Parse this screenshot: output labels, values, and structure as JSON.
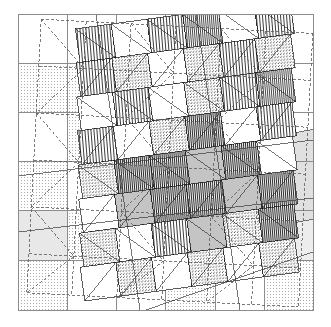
{
  "figure": {
    "name": "overlaid-triangulated-meshes",
    "caption_residue": "· · · · ·",
    "background_color": "#ffffff",
    "frame": {
      "x": 18,
      "y": 14,
      "width": 295,
      "height": 296,
      "stroke": "#8c8c8c",
      "stroke_width": 1
    },
    "layers": [
      {
        "id": "base-grid",
        "label": "axis-aligned background grid",
        "style": "solid",
        "stroke": "#8c8c8c",
        "stroke_width": 1,
        "rotation_deg": 0,
        "cols": 6,
        "rows": 6
      },
      {
        "id": "dashed-grid",
        "label": "dashed intermediate mesh",
        "style": "dashed",
        "stroke": "#6e6e6e",
        "stroke_width": 0.8,
        "dash": "3 2",
        "rotation_deg": 3,
        "cols": 6,
        "rows": 6
      },
      {
        "id": "rotated-mesh",
        "label": "rotated triangulated mesh",
        "style": "solid",
        "stroke": "#1a1a1a",
        "stroke_width": 0.7,
        "rotation_deg": -5,
        "cols": 7,
        "rows": 7
      }
    ],
    "fills": {
      "white": "#ffffff",
      "stipple_light": "#f2f2f2",
      "stipple_mid": "#dcdcdc",
      "gray_light": "#e6e6e6",
      "gray_mid": "#bdbdbd",
      "hatch_vertical": "#5a5a5a",
      "hatch_dense": "#2b2b2b",
      "solid_dark": "#3a3a3a"
    },
    "base_cell_fills": [
      [
        "white",
        "white",
        "white",
        "white",
        "white",
        "white"
      ],
      [
        "stipple_light",
        "stipple_light",
        "white",
        "white",
        "white",
        "white"
      ],
      [
        "white",
        "stipple_light",
        "white",
        "white",
        "white",
        "white"
      ],
      [
        "stipple_light",
        "white",
        "white",
        "white",
        "white",
        "white"
      ],
      [
        "gray_light",
        "stipple_light",
        "white",
        "white",
        "white",
        "gray_light"
      ],
      [
        "stipple_light",
        "white",
        "white",
        "stipple_light",
        "white",
        "stipple_light"
      ]
    ],
    "mesh_patterns": [
      [
        "hatch_v",
        "hatch_v",
        "white",
        "hatch_v",
        "white",
        "hatch_v",
        "hatch_v"
      ],
      [
        "hatch_v",
        "stipple_mid",
        "hatch_v",
        "stipple_mid",
        "hatch_v",
        "white",
        "stipple_mid"
      ],
      [
        "white",
        "hatch_v",
        "white",
        "stipple_mid",
        "hatch_v",
        "hatch_v",
        "white"
      ],
      [
        "hatch_v",
        "white",
        "stipple_mid",
        "hatch_dense",
        "white",
        "hatch_v",
        "stipple_mid"
      ],
      [
        "stipple_mid",
        "hatch_dense",
        "hatch_dense",
        "gray_mid",
        "hatch_dense",
        "white",
        "stipple_mid"
      ],
      [
        "white",
        "gray_mid",
        "hatch_dense",
        "hatch_dense",
        "gray_mid",
        "hatch_dense",
        "white"
      ],
      [
        "stipple_mid",
        "white",
        "hatch_v",
        "gray_mid",
        "stipple_mid",
        "hatch_dense",
        "stipple_mid"
      ]
    ]
  }
}
